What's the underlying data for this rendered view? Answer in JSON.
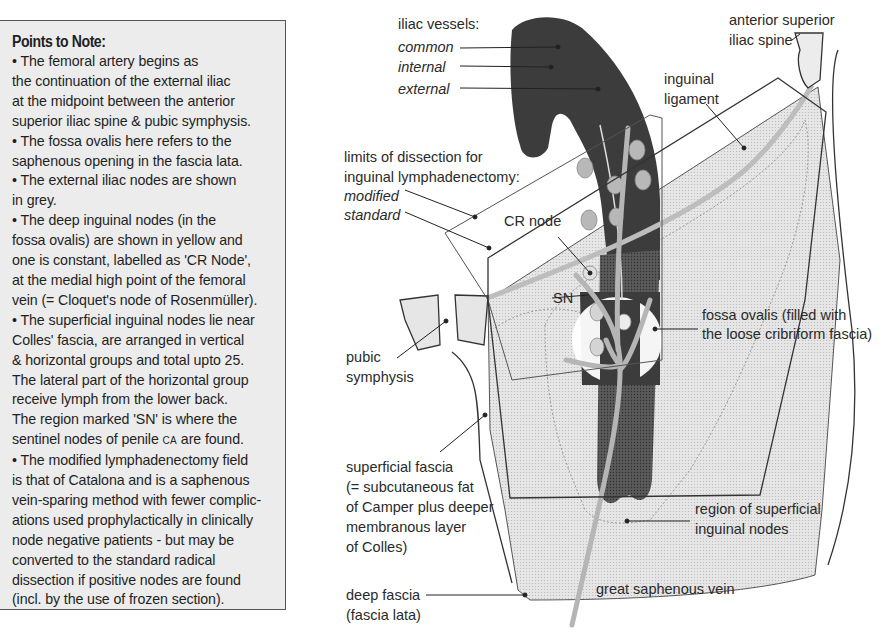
{
  "notes": {
    "title": "Points to Note:",
    "lines": [
      {
        "text": "• The femoral artery begins as"
      },
      {
        "text": "the continuation of the external iliac"
      },
      {
        "text": "at the midpoint between the anterior"
      },
      {
        "text": "superior iliac spine & pubic symphysis."
      },
      {
        "text": "• The fossa ovalis here refers to the"
      },
      {
        "text": "saphenous opening in the fascia lata."
      },
      {
        "text": "• The external iliac nodes are shown"
      },
      {
        "text": "in grey."
      },
      {
        "text": "• The deep inguinal nodes (in the"
      },
      {
        "text": "fossa ovalis) are shown in yellow and"
      },
      {
        "text": "one is constant, labelled as 'CR Node',"
      },
      {
        "text": "at the medial high point of the femoral"
      },
      {
        "text": "vein (= Cloquet's node of Rosenmüller)."
      },
      {
        "text": "• The superficial inguinal nodes lie near"
      },
      {
        "text": "Colles' fascia, are arranged in vertical"
      },
      {
        "text": "& horizontal groups and total upto 25."
      },
      {
        "text": "The lateral part of the horizontal group"
      },
      {
        "text": "receive lymph from the lower back."
      },
      {
        "text": "The region marked 'SN' is where the"
      },
      {
        "text_before": "sentinel nodes of penile ",
        "smallcaps": "CA",
        "text_after": " are found."
      },
      {
        "text": "• The modified lymphadenectomy field"
      },
      {
        "text": "is that of Catalona and is a saphenous"
      },
      {
        "text": "vein-sparing method with fewer complic-"
      },
      {
        "text": "ations used prophylactically in clinically"
      },
      {
        "text": "node negative patients - but may be"
      },
      {
        "text": "converted to the standard radical"
      },
      {
        "text": "dissection if positive nodes are found"
      },
      {
        "text": "(incl. by the use of frozen section)."
      }
    ]
  },
  "labels": {
    "iliac_vessels": "iliac vessels:",
    "common": "common",
    "internal": "internal",
    "external": "external",
    "limits_1": "limits of dissection for",
    "limits_2": "inguinal lymphadenectomy:",
    "modified": "modified",
    "standard": "standard",
    "cr_node": "CR node",
    "sn": "SN",
    "pubic_1": "pubic",
    "pubic_2": "symphysis",
    "asis_1": "anterior superior",
    "asis_2": "iliac spine",
    "inguinal_1": "inguinal",
    "inguinal_2": "ligament",
    "fossa_1": "fossa ovalis (filled with",
    "fossa_2": "the loose cribriform fascia)",
    "sup_fascia_1": "superficial fascia",
    "sup_fascia_2": "(= subcutaneous fat",
    "sup_fascia_3": "of Camper plus deeper",
    "sup_fascia_4": "membranous layer",
    "sup_fascia_5": "of Colles)",
    "region_1": "region of superficial",
    "region_2": "inguinal nodes",
    "gsv": "great saphenous vein",
    "deep_fascia_1": "deep fascia",
    "deep_fascia_2": "(fascia lata)"
  },
  "colors": {
    "vessel_dark": "#3c3c3c",
    "node_grey": "#b8b8b8",
    "thigh_fill": "#e4e4e4",
    "ligament": "#bdbdbd",
    "note_bg": "#ececec"
  }
}
